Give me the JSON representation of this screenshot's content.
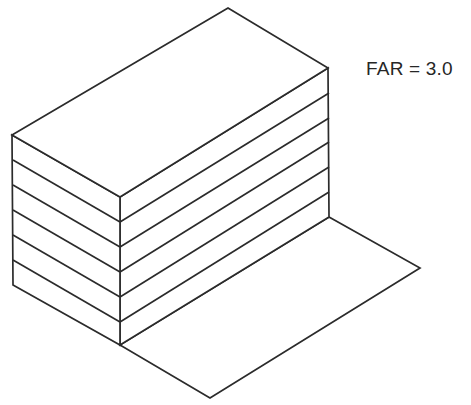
{
  "figure": {
    "kind": "axonometric-massing-diagram",
    "title": "FAR = 3.0",
    "annotation": {
      "label": "FAR = 3.0",
      "x": 366,
      "y": 58,
      "font_size_px": 19,
      "color": "#262626"
    },
    "canvas": {
      "width": 471,
      "height": 405,
      "background": "#ffffff"
    },
    "style": {
      "line_color": "#2b2b2b",
      "line_width": 1.7,
      "fill_color": "#ffffff"
    },
    "building": {
      "name": "stacked-floor-block",
      "floor_count": 6,
      "division_line_count": 5,
      "vertices": {
        "top_rear": [
          228,
          8
        ],
        "top_left": [
          12,
          135
        ],
        "top_right": [
          328,
          68
        ],
        "top_front": [
          120,
          197
        ],
        "base_left": [
          13,
          285
        ],
        "base_right": [
          329,
          217
        ],
        "base_front": [
          120,
          345
        ]
      },
      "top_face_path": "M228,8 L12,135 L120,197 L328,68 Z",
      "left_face_path": "M12,135 L120,197 L120,345 L13,285 Z",
      "right_face_path": "M120,197 L328,68 L329,217 L120,345 Z",
      "left_face_division_lines": [
        "M13,160 L120,222",
        "M13,185 L120,247",
        "M13,210 L120,272",
        "M13,235 L120,297",
        "M13,260 L120,322"
      ],
      "right_face_division_lines": [
        "M120,222 L329,93",
        "M120,247 L329,118",
        "M120,272 L329,142",
        "M120,297 L329,167",
        "M120,322 L329,192"
      ]
    },
    "ground_plane": {
      "name": "site-plane",
      "path": "M120,345 L329,217 L420,268 L210,398 Z",
      "vertices": {
        "near_left": [
          120,
          345
        ],
        "far_left": [
          329,
          217
        ],
        "far_right": [
          420,
          268
        ],
        "near_right": [
          210,
          398
        ]
      }
    }
  }
}
